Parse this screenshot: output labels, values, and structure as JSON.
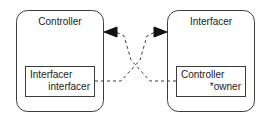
{
  "diagram": {
    "type": "object-relationship-diagram",
    "background_color": "#ffffff",
    "stroke_color": "#3c3c3c",
    "text_color": "#1a1a1a",
    "nodes": [
      {
        "id": "controller",
        "title": "Controller",
        "field_lines": [
          "Interfacer",
          "interfacer"
        ]
      },
      {
        "id": "interfacer",
        "title": "Interfacer",
        "field_lines": [
          "Controller",
          "*owner"
        ]
      }
    ],
    "connectors": [
      {
        "id": "interfacer-field-to-interfacer-object",
        "style": "dashed",
        "arrowhead": "right",
        "from": "controller.interfacer-field",
        "to": "interfacer-object"
      },
      {
        "id": "owner-field-to-controller-object",
        "style": "dashed",
        "arrowhead": "left",
        "from": "interfacer.owner-field",
        "to": "controller-object"
      }
    ]
  }
}
